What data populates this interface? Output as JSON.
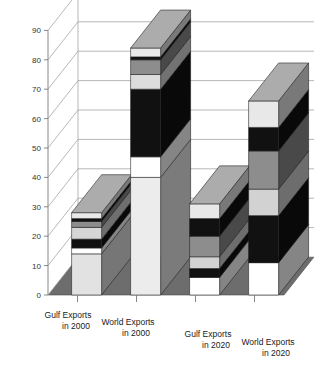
{
  "chart_data": {
    "type": "bar",
    "subtype": "stacked-3d-column",
    "title": "",
    "xlabel": "",
    "ylabel": "",
    "ylim": [
      0,
      90
    ],
    "ytick_step": 10,
    "yticks": [
      "0",
      "10",
      "20",
      "30",
      "40",
      "50",
      "60",
      "70",
      "80",
      "90"
    ],
    "grid": true,
    "legend": "none",
    "categories": [
      "Gulf Exports in 2000",
      "World Exports in 2000",
      "Gulf Exports in 2020",
      "World Exports in 2020"
    ],
    "category_lines": [
      [
        "Gulf Exports",
        "in 2000"
      ],
      [
        "World Exports",
        "in 2000"
      ],
      [
        "Gulf Exports",
        "in 2020"
      ],
      [
        "World Exports",
        "in 2020"
      ]
    ],
    "totals": [
      28,
      84,
      31,
      66
    ],
    "stacks": [
      {
        "category": "Gulf Exports in 2000",
        "total": 28,
        "segments": [
          {
            "value": 14,
            "color": "#e2e2e2",
            "shade": "light-gray"
          },
          {
            "value": 2,
            "color": "#ffffff",
            "shade": "white"
          },
          {
            "value": 3,
            "color": "#111111",
            "shade": "black"
          },
          {
            "value": 4,
            "color": "#d6d6d6",
            "shade": "light-gray"
          },
          {
            "value": 2,
            "color": "#8d8d8d",
            "shade": "medium-gray"
          },
          {
            "value": 1,
            "color": "#111111",
            "shade": "black"
          },
          {
            "value": 2,
            "color": "#e8e8e8",
            "shade": "light-gray"
          }
        ]
      },
      {
        "category": "World Exports in 2000",
        "total": 84,
        "segments": [
          {
            "value": 40,
            "color": "#ececec",
            "shade": "light-gray"
          },
          {
            "value": 7,
            "color": "#ffffff",
            "shade": "white"
          },
          {
            "value": 23,
            "color": "#111111",
            "shade": "black"
          },
          {
            "value": 5,
            "color": "#dcdcdc",
            "shade": "light-gray"
          },
          {
            "value": 5,
            "color": "#8d8d8d",
            "shade": "medium-gray"
          },
          {
            "value": 1,
            "color": "#111111",
            "shade": "black"
          },
          {
            "value": 3,
            "color": "#e8e8e8",
            "shade": "light-gray"
          }
        ]
      },
      {
        "category": "Gulf Exports in 2020",
        "total": 31,
        "segments": [
          {
            "value": 6,
            "color": "#ffffff",
            "shade": "white"
          },
          {
            "value": 3,
            "color": "#111111",
            "shade": "black"
          },
          {
            "value": 4,
            "color": "#d2d2d2",
            "shade": "light-gray"
          },
          {
            "value": 7,
            "color": "#8d8d8d",
            "shade": "medium-gray"
          },
          {
            "value": 6,
            "color": "#111111",
            "shade": "black"
          },
          {
            "value": 5,
            "color": "#e8e8e8",
            "shade": "light-gray"
          }
        ]
      },
      {
        "category": "World Exports in 2020",
        "total": 66,
        "segments": [
          {
            "value": 11,
            "color": "#ffffff",
            "shade": "white"
          },
          {
            "value": 16,
            "color": "#111111",
            "shade": "black"
          },
          {
            "value": 9,
            "color": "#d2d2d2",
            "shade": "light-gray"
          },
          {
            "value": 13,
            "color": "#8d8d8d",
            "shade": "medium-gray"
          },
          {
            "value": 8,
            "color": "#111111",
            "shade": "black"
          },
          {
            "value": 9,
            "color": "#e8e8e8",
            "shade": "light-gray"
          }
        ]
      }
    ],
    "colors": {
      "floor": "#6d6d6d",
      "wall": "#ffffff",
      "gridline": "#9a9a9a",
      "axis": "#7a7a7a",
      "text": "#1a1a1a",
      "bar_side": "#5a5a5a",
      "bar_top": "#8a8a8a"
    }
  }
}
